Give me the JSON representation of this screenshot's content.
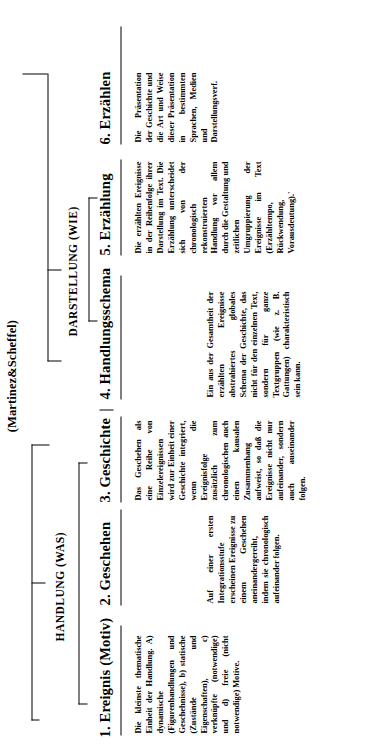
{
  "source_note": "(Martinez&Scheffel)",
  "groups": [
    {
      "id": "handlung",
      "label": "HANDLUNG (WAS)"
    },
    {
      "id": "darstellung",
      "label": "DARSTELLUNG (WIE)"
    }
  ],
  "columns": [
    {
      "index": 1,
      "heading": "1. Ereignis (Motiv)",
      "text": "Die kleinste thematische Einheit der Handlung. A) dynamische (Figurenhandlungen und Geschehnisse), b) statische (Zustände und Eigenschaften), c) verknüpfte (notwendige) und d) freie (nicht notwendige) Motive."
    },
    {
      "index": 2,
      "heading": "2. Geschehen",
      "text": "Auf einer ersten Integrationsstufe erscheinen Ereignisse zu einem Geschehen aneinandergereiht, indem sie chronologisch aufeinander folgen."
    },
    {
      "index": 3,
      "heading": "3. Geschichte",
      "text": "Das Geschehen als eine Reihe von Einzelereignissen wird zur Einheit einer Geschichte integriert, wenn die Ereignisfolge zusätzlich zum chronologischen auch einen kausalen Zusammenhang aufweist, so daß die Ereignisse nicht nur aufeinander, sondern auch auseinander folgen."
    },
    {
      "index": 4,
      "heading": "4. Handlungsschema",
      "text": "Ein aus der Gesamtheit der erzählten Ereignisse abstrahiertes globales Schema der Geschichte, das nicht für den einzelnen Text, sondern für ganze Textgruppen (wie z. B. Gattungen) charakteristisch sein kann."
    },
    {
      "index": 5,
      "heading": "5. Erzählung",
      "text": "Die erzählten Ereignisse in der Reihenfolge ihrer Darstellung im Text. Die Erzählung unterscheidet sich von der chronologisch rekonstruierten Handlung vor allem durch die Gestaltung und zeitlichen Umgruppierung der Ereignisse im Text (Erzähltempo, Rückwendung, Vorausdeutung).'"
    },
    {
      "index": 6,
      "heading": "6. Erzählen",
      "text": "Die Präsentation der Geschichte und die Art und Weise dieser Präsentation in bestimmten Sprachen, Medien und Darstellungsverf."
    }
  ],
  "colors": {
    "ink": "#000000",
    "paper": "#ffffff"
  }
}
